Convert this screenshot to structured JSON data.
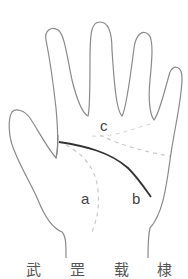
{
  "figure": {
    "labels": {
      "a": "a",
      "b": "b",
      "c": "c"
    },
    "caption": "武 罡 载 棣",
    "colors": {
      "outline": "#8a8a8a",
      "solid_line": "#333333",
      "dashed_line": "#c8c8c8",
      "label": "#444444",
      "background": "#ffffff"
    }
  }
}
